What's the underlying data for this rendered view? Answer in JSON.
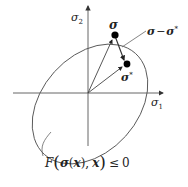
{
  "diagram": {
    "axes": {
      "horizontal_label_base": "σ",
      "horizontal_label_sub": "1",
      "vertical_label_base": "σ",
      "vertical_label_sub": "2"
    },
    "points": {
      "trial_stress": "σ",
      "projected_stress": "σ",
      "projected_stress_sup": "*"
    },
    "difference_label": {
      "a": "σ",
      "minus": "−",
      "b": "σ",
      "b_sup": "*"
    },
    "region_label": {
      "F": "F",
      "open_paren": "(",
      "sigma": "σ",
      "arg_open": "(",
      "x1": "x",
      "arg_close": ")",
      "comma": ",",
      "x2": "x",
      "close_paren": ")",
      "relation": "≤",
      "value": "0"
    }
  }
}
